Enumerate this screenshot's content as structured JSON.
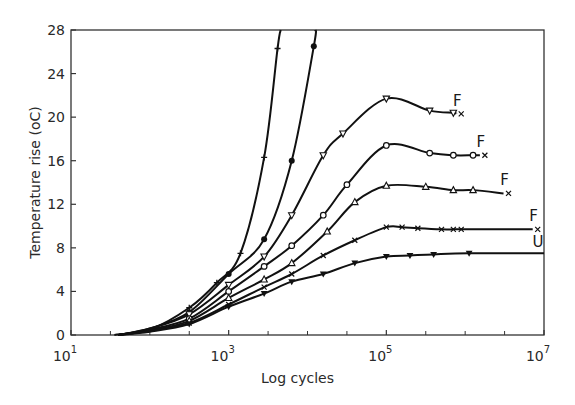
{
  "chart_data": {
    "type": "line",
    "title": "",
    "xlabel": "Log cycles",
    "ylabel": "Temperature rise (oC)",
    "xscale": "log",
    "xlim_log10": [
      1,
      7
    ],
    "ylim": [
      0,
      28
    ],
    "grid": false,
    "legend": "none (curves labelled at right end: F = failure, U = unfailed)",
    "x_ticks": [
      {
        "log10": 1,
        "base": "10",
        "exp": "1"
      },
      {
        "log10": 3,
        "base": "10",
        "exp": "3"
      },
      {
        "log10": 5,
        "base": "10",
        "exp": "5"
      },
      {
        "log10": 7,
        "base": "10",
        "exp": "7"
      }
    ],
    "x_minor_ticks_log10": [
      1.5,
      2,
      2.5,
      3.5,
      4,
      4.5,
      5.5,
      6,
      6.5
    ],
    "y_ticks": [
      0,
      4,
      8,
      12,
      16,
      20,
      24,
      28
    ],
    "series": [
      {
        "name": "plus-marker curve",
        "marker": "plus",
        "end_label": "",
        "points_log10x": [
          [
            1.55,
            0
          ],
          [
            2.0,
            0.5
          ],
          [
            2.5,
            2.5
          ],
          [
            2.85,
            4.8
          ],
          [
            3.15,
            7.5
          ],
          [
            3.45,
            16.3
          ],
          [
            3.62,
            26.3
          ],
          [
            3.66,
            28
          ]
        ]
      },
      {
        "name": "filled-circle curve",
        "marker": "filled-circle",
        "end_label": "",
        "points_log10x": [
          [
            1.6,
            0
          ],
          [
            2.0,
            0.6
          ],
          [
            2.5,
            2.1
          ],
          [
            3.0,
            5.6
          ],
          [
            3.45,
            8.8
          ],
          [
            3.8,
            16.0
          ],
          [
            4.08,
            26.5
          ],
          [
            4.1,
            28
          ]
        ]
      },
      {
        "name": "inverted-triangle curve",
        "marker": "open-inverted-triangle",
        "end_label": "F",
        "points_log10x": [
          [
            1.6,
            0
          ],
          [
            2.0,
            0.6
          ],
          [
            2.5,
            1.9
          ],
          [
            3.0,
            4.6
          ],
          [
            3.45,
            7.2
          ],
          [
            3.8,
            11.0
          ],
          [
            4.2,
            16.5
          ],
          [
            4.45,
            18.5
          ],
          [
            5.0,
            21.7
          ],
          [
            5.55,
            20.6
          ],
          [
            5.85,
            20.4
          ]
        ],
        "failure_point": [
          5.95,
          20.3
        ]
      },
      {
        "name": "open-circle curve",
        "marker": "open-circle",
        "end_label": "F",
        "points_log10x": [
          [
            1.6,
            0
          ],
          [
            2.0,
            0.5
          ],
          [
            2.5,
            1.5
          ],
          [
            3.0,
            4.0
          ],
          [
            3.45,
            6.3
          ],
          [
            3.8,
            8.2
          ],
          [
            4.2,
            11.0
          ],
          [
            4.5,
            13.8
          ],
          [
            5.0,
            17.4
          ],
          [
            5.55,
            16.7
          ],
          [
            5.85,
            16.5
          ],
          [
            6.1,
            16.5
          ]
        ],
        "failure_point": [
          6.25,
          16.5
        ]
      },
      {
        "name": "open-triangle curve",
        "marker": "open-triangle",
        "end_label": "F",
        "points_log10x": [
          [
            1.6,
            0
          ],
          [
            2.0,
            0.4
          ],
          [
            2.5,
            1.3
          ],
          [
            3.0,
            3.4
          ],
          [
            3.45,
            5.1
          ],
          [
            3.8,
            6.6
          ],
          [
            4.25,
            9.5
          ],
          [
            4.6,
            12.2
          ],
          [
            5.0,
            13.7
          ],
          [
            5.5,
            13.6
          ],
          [
            5.85,
            13.3
          ],
          [
            6.1,
            13.3
          ]
        ],
        "failure_point": [
          6.55,
          13.0
        ]
      },
      {
        "name": "cross-marker curve",
        "marker": "cross",
        "end_label": "F",
        "points_log10x": [
          [
            1.6,
            0
          ],
          [
            2.0,
            0.4
          ],
          [
            2.5,
            1.1
          ],
          [
            3.0,
            2.8
          ],
          [
            3.45,
            4.4
          ],
          [
            3.8,
            5.6
          ],
          [
            4.2,
            7.3
          ],
          [
            4.6,
            8.7
          ],
          [
            5.0,
            9.9
          ],
          [
            5.2,
            9.9
          ],
          [
            5.4,
            9.8
          ],
          [
            5.7,
            9.7
          ],
          [
            5.85,
            9.7
          ],
          [
            5.95,
            9.7
          ]
        ],
        "failure_point": [
          6.92,
          9.7
        ]
      },
      {
        "name": "filled-inverted-triangle curve",
        "marker": "filled-inverted-triangle",
        "end_label": "U",
        "points_log10x": [
          [
            1.6,
            0
          ],
          [
            2.0,
            0.3
          ],
          [
            2.5,
            1.0
          ],
          [
            3.0,
            2.6
          ],
          [
            3.45,
            3.8
          ],
          [
            3.8,
            4.9
          ],
          [
            4.2,
            5.6
          ],
          [
            4.6,
            6.6
          ],
          [
            5.0,
            7.2
          ],
          [
            5.3,
            7.3
          ],
          [
            5.6,
            7.4
          ],
          [
            6.05,
            7.5
          ],
          [
            7.0,
            7.5
          ]
        ]
      }
    ]
  }
}
